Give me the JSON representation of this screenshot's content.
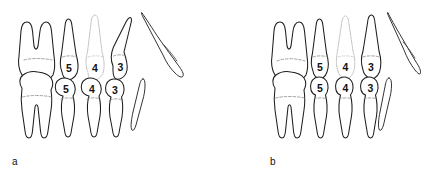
{
  "figure": {
    "background_color": "#ffffff",
    "ink_color": "#1d1d1d",
    "ghost_color": "#b9b9b9",
    "cej_color": "#8d8d8d",
    "width": 421,
    "height": 179
  },
  "panels": [
    {
      "id": "a",
      "label": "a",
      "label_x": 12,
      "label_y": 165,
      "origin_x": 0,
      "upper_row": {
        "name": "upper-arch-row",
        "teeth": [
          {
            "name": "upper-molar",
            "label": "",
            "numbered": false,
            "ghost": false,
            "roots": 2,
            "cx": 42,
            "crown_y": 62
          },
          {
            "name": "upper-premolar-5",
            "label": "5",
            "numbered": true,
            "ghost": false,
            "roots": 1,
            "cx": 68,
            "crown_y": 66
          },
          {
            "name": "upper-premolar-4",
            "label": "4",
            "numbered": true,
            "ghost": true,
            "roots": 1,
            "cx": 94,
            "crown_y": 66
          },
          {
            "name": "upper-canine-3",
            "label": "3",
            "numbered": true,
            "ghost": false,
            "roots": 1,
            "cx": 121,
            "crown_y": 64
          }
        ]
      },
      "lower_row": {
        "name": "lower-arch-row",
        "teeth": [
          {
            "name": "lower-molar",
            "label": "",
            "numbered": false,
            "ghost": false,
            "roots": 2,
            "cx": 40,
            "crown_y": 92
          },
          {
            "name": "lower-premolar-5",
            "label": "5",
            "numbered": true,
            "ghost": false,
            "roots": 1,
            "cx": 66,
            "crown_y": 90
          },
          {
            "name": "lower-premolar-4",
            "label": "4",
            "numbered": true,
            "ghost": false,
            "roots": 1,
            "cx": 92,
            "crown_y": 90
          },
          {
            "name": "lower-canine-3",
            "label": "3",
            "numbered": true,
            "ghost": false,
            "roots": 1,
            "cx": 116,
            "crown_y": 92
          }
        ]
      },
      "isolated_teeth": [
        {
          "name": "isolated-tooth-upper",
          "orientation": "tilted",
          "cx": 168,
          "cy": 52
        },
        {
          "name": "isolated-tooth-lower",
          "orientation": "slim",
          "cx": 141,
          "cy": 102
        }
      ]
    },
    {
      "id": "b",
      "label": "b",
      "label_x": 270,
      "label_y": 165,
      "origin_x": 258,
      "upper_row": {
        "name": "upper-arch-row",
        "teeth": [
          {
            "name": "upper-molar",
            "label": "",
            "numbered": false,
            "ghost": false,
            "roots": 2,
            "cx": 295,
            "crown_y": 62
          },
          {
            "name": "upper-premolar-5",
            "label": "5",
            "numbered": true,
            "ghost": false,
            "roots": 1,
            "cx": 320,
            "crown_y": 66
          },
          {
            "name": "upper-premolar-4",
            "label": "4",
            "numbered": true,
            "ghost": true,
            "roots": 1,
            "cx": 345,
            "crown_y": 66
          },
          {
            "name": "upper-canine-3",
            "label": "3",
            "numbered": true,
            "ghost": false,
            "roots": 1,
            "cx": 370,
            "crown_y": 64
          }
        ]
      },
      "lower_row": {
        "name": "lower-arch-row",
        "teeth": [
          {
            "name": "lower-molar",
            "label": "",
            "numbered": false,
            "ghost": false,
            "roots": 2,
            "cx": 295,
            "crown_y": 92
          },
          {
            "name": "lower-premolar-5",
            "label": "5",
            "numbered": true,
            "ghost": false,
            "roots": 1,
            "cx": 320,
            "crown_y": 90
          },
          {
            "name": "lower-premolar-4",
            "label": "4",
            "numbered": true,
            "ghost": false,
            "roots": 1,
            "cx": 345,
            "crown_y": 90
          },
          {
            "name": "lower-canine-3",
            "label": "3",
            "numbered": true,
            "ghost": false,
            "roots": 1,
            "cx": 370,
            "crown_y": 90
          }
        ]
      },
      "isolated_teeth": [
        {
          "name": "isolated-tooth-upper",
          "orientation": "tilted",
          "cx": 400,
          "cy": 52
        },
        {
          "name": "isolated-tooth-lower",
          "orientation": "slim",
          "cx": 382,
          "cy": 102
        }
      ]
    }
  ],
  "numbers": {
    "a_upper_5": "5",
    "a_upper_4": "4",
    "a_upper_3": "3",
    "a_lower_5": "5",
    "a_lower_4": "4",
    "a_lower_3": "3",
    "b_upper_5": "5",
    "b_upper_4": "4",
    "b_upper_3": "3",
    "b_lower_5": "5",
    "b_lower_4": "4",
    "b_lower_3": "3"
  },
  "labels": {
    "panel_a": "a",
    "panel_b": "b"
  }
}
